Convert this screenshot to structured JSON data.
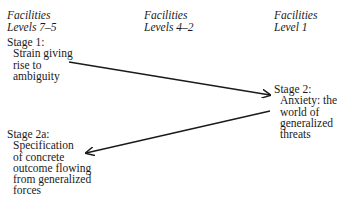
{
  "columns": [
    {
      "line1": "Facilities",
      "line2": "Levels 7–5"
    },
    {
      "line1": "Facilities",
      "line2": "Levels 4–2"
    },
    {
      "line1": "Facilities",
      "line2": "Level 1"
    }
  ],
  "stages": {
    "stage1": {
      "title": "Stage 1:",
      "lines": [
        "Strain giving",
        "rise to",
        "ambiguity"
      ]
    },
    "stage2": {
      "title": "Stage 2:",
      "lines": [
        "Anxiety: the",
        "world of",
        "generalized",
        "threats"
      ]
    },
    "stage2a": {
      "title": "Stage 2a:",
      "lines": [
        "Specification",
        "of concrete",
        "outcome flowing",
        "from generalized",
        "forces"
      ]
    }
  },
  "arrows": [
    {
      "from": "stage1",
      "to": "stage2",
      "x1": 69,
      "y1": 62,
      "x2": 270,
      "y2": 95
    },
    {
      "from": "stage2",
      "to": "stage2a",
      "x1": 270,
      "y1": 111,
      "x2": 86,
      "y2": 153
    }
  ],
  "colors": {
    "ink": "#1a1a1a",
    "background": "#ffffff"
  }
}
